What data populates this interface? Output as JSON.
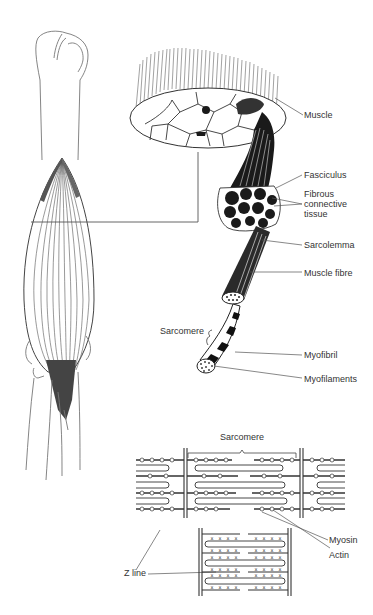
{
  "figure": {
    "colors": {
      "ink": "#222222",
      "line": "#555555",
      "fill_dark": "#1a1a1a",
      "text": "#333333",
      "background": "#ffffff"
    }
  },
  "labels": {
    "muscle": "Muscle",
    "fasciculus": "Fasciculus",
    "fibrous_1": "Fibrous",
    "fibrous_2": "connective",
    "fibrous_3": "tissue",
    "sarcolemma": "Sarcolemma",
    "muscle_fibre": "Muscle fibre",
    "sarcomere_top": "Sarcomere",
    "myofibril": "Myofibril",
    "myofilaments": "Myofilaments",
    "sarcomere_bottom": "Sarcomere",
    "myosin": "Myosin",
    "actin": "Actin",
    "z_line": "Z line"
  }
}
